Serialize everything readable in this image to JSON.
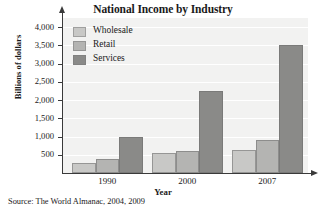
{
  "chart_data": {
    "type": "bar",
    "title": "National Income by Industry",
    "xlabel": "Year",
    "ylabel": "Billions of dollars",
    "categories": [
      "1990",
      "2000",
      "2007"
    ],
    "series": [
      {
        "name": "Wholesale",
        "values": [
          280,
          560,
          620
        ],
        "color": "#c8c8c6"
      },
      {
        "name": "Retail",
        "values": [
          390,
          590,
          900
        ],
        "color": "#b4b4b2"
      },
      {
        "name": "Services",
        "values": [
          990,
          2250,
          3520
        ],
        "color": "#8a8a88"
      }
    ],
    "ylim": [
      0,
      4250
    ],
    "yticks": [
      500,
      1000,
      1500,
      2000,
      2500,
      3000,
      3500,
      4000
    ],
    "ytick_labels": [
      "500",
      "1,000",
      "1,500",
      "2,000",
      "2,500",
      "3,000",
      "3,500",
      "4,000"
    ],
    "grid": true,
    "legend_position": "top-left-inside",
    "plot_background": "#f2f2f1",
    "axis_color": "#3a3a3a",
    "gridline_color": "#ffffff"
  },
  "source": {
    "note": "Source: The World Almanac, 2004, 2009"
  }
}
